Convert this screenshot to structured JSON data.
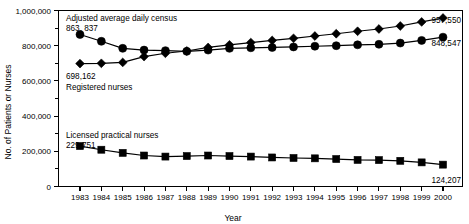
{
  "figure": {
    "name": "nurses-and-census-line-chart"
  },
  "axes": {
    "y_title": "No. of Patients or Nurses",
    "x_title": "Year",
    "y_ticks_major": [
      "0",
      "200,000",
      "400,000",
      "600,000",
      "800,000",
      "1,000,000"
    ],
    "x_ticks": [
      "1983",
      "1984",
      "1985",
      "1986",
      "1987",
      "1988",
      "1989",
      "1990",
      "1991",
      "1992",
      "1993",
      "1994",
      "1995",
      "1996",
      "1997",
      "1998",
      "1999",
      "2000"
    ]
  },
  "annotations": {
    "census_label": "Adjusted average daily census",
    "census_start_value": "863, 837",
    "rn_start_value": "698,162",
    "rn_label": "Registered nurses",
    "lpn_label": "Licensed practical nurses",
    "lpn_start_value": "229,751",
    "census_end_value": "848,547",
    "rn_end_value": "957,550",
    "lpn_end_value": "124,207"
  },
  "colors": {
    "ink": "#000000",
    "background": "#ffffff"
  },
  "chart_data": {
    "type": "line",
    "title": "",
    "xlabel": "Year",
    "ylabel": "No. of Patients or Nurses",
    "xlim": [
      1983,
      2000
    ],
    "ylim": [
      0,
      1000000
    ],
    "ytick_interval_major": 200000,
    "ytick_interval_minor": 100000,
    "grid": false,
    "legend": "inline-annotations",
    "categories": [
      1983,
      1984,
      1985,
      1986,
      1987,
      1988,
      1989,
      1990,
      1991,
      1992,
      1993,
      1994,
      1995,
      1996,
      1997,
      1998,
      1999,
      2000
    ],
    "series": [
      {
        "name": "Adjusted average daily census",
        "marker": "circle",
        "values": [
          863837,
          825000,
          785000,
          775000,
          772000,
          768000,
          775000,
          785000,
          788000,
          790000,
          793000,
          797000,
          800000,
          805000,
          808000,
          815000,
          830000,
          848547
        ]
      },
      {
        "name": "Registered nurses",
        "marker": "diamond",
        "values": [
          698162,
          700000,
          705000,
          738000,
          757000,
          770000,
          790000,
          805000,
          818000,
          830000,
          842000,
          855000,
          868000,
          882000,
          895000,
          912000,
          935000,
          957550
        ]
      },
      {
        "name": "Licensed practical nurses",
        "marker": "square",
        "values": [
          229751,
          209000,
          191000,
          176000,
          170000,
          173000,
          176000,
          173000,
          170000,
          165000,
          162000,
          160000,
          156000,
          151000,
          150000,
          146000,
          137000,
          124207
        ]
      }
    ]
  }
}
